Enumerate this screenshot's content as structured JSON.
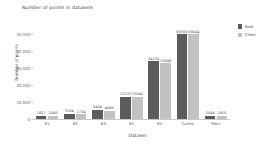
{
  "chart_data": {
    "type": "bar",
    "title": "Number of points in datasets",
    "xlabel": "Dataset",
    "ylabel": "Number of points",
    "categories": [
      "B1",
      "B2",
      "B3",
      "B4",
      "B5",
      "Turkey",
      "Mars"
    ],
    "series": [
      {
        "name": "Real",
        "color": "#5c5c5c",
        "values": [
          1812,
          3104,
          5404,
          13233,
          34130,
          50060,
          2044
        ],
        "labels": [
          "1812",
          "3104",
          "5404",
          "13233",
          "34130",
          "50060",
          "2044"
        ]
      },
      {
        "name": "Clean",
        "color": "#c2c2c2",
        "values": [
          2040,
          2734,
          4690,
          13040,
          32848,
          50044,
          1915
        ],
        "labels": [
          "2040",
          "2734",
          "4690",
          "13040",
          "32848",
          "50044",
          "1915"
        ]
      }
    ],
    "ylim": [
      0,
      55000
    ],
    "yticks": [
      0,
      10000,
      20000,
      30000,
      40000,
      50000
    ],
    "ytick_labels": [
      "0",
      "10,000",
      "20,000",
      "30,000",
      "40,000",
      "50,000"
    ],
    "grid": false,
    "legend_position": "right"
  }
}
